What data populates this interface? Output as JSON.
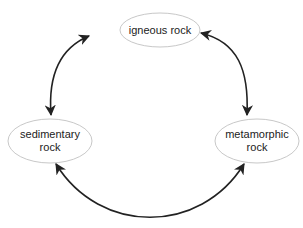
{
  "diagram": {
    "nodes": [
      {
        "id": "igneous",
        "lines": [
          "igneous rock"
        ]
      },
      {
        "id": "sedimentary",
        "lines": [
          "sedimentary",
          "rock"
        ]
      },
      {
        "id": "metamorphic",
        "lines": [
          "metamorphic",
          "rock"
        ]
      }
    ],
    "edges": [
      {
        "from": "igneous",
        "to": "sedimentary",
        "bidirectional": true
      },
      {
        "from": "igneous",
        "to": "metamorphic",
        "bidirectional": true
      },
      {
        "from": "sedimentary",
        "to": "metamorphic",
        "bidirectional": true
      }
    ],
    "colors": {
      "ellipse_stroke": "#c8c8c8",
      "arrow": "#222222",
      "background": "#ffffff"
    }
  }
}
